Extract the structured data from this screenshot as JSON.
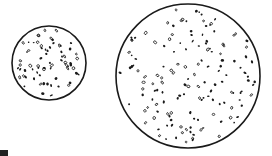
{
  "diagram": {
    "colors": {
      "background": "#ffffff",
      "stroke": "#1a1a1a",
      "dot": "#1a1a1a"
    },
    "circles": [
      {
        "id": "small",
        "cx": 49,
        "cy": 63,
        "r": 37,
        "dot_count": 70,
        "seed": 7
      },
      {
        "id": "large",
        "cx": 188,
        "cy": 76,
        "r": 72,
        "dot_count": 150,
        "seed": 19
      }
    ]
  }
}
